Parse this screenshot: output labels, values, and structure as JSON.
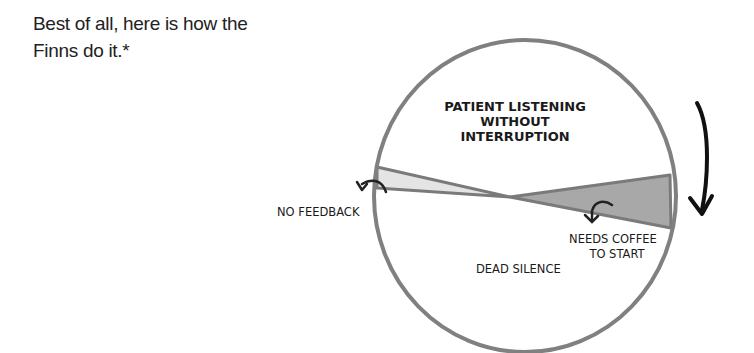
{
  "intro": {
    "line1": "Best of all, here is how the",
    "line2": "Finns do it.*"
  },
  "diagram": {
    "type": "conversation-wheel",
    "labels": {
      "top_line1": "PATIENT LISTENING",
      "top_line2": "WITHOUT",
      "top_line3": "INTERRUPTION",
      "left": "NO FEEDBACK",
      "right_line1": "NEEDS COFFEE",
      "right_line2": "TO START",
      "bottom": "DEAD SILENCE"
    },
    "colors": {
      "outline": "#808080",
      "left_wedge": "#e4e4e4",
      "right_wedge": "#a8a8a8",
      "arrow": "#111111"
    },
    "rotation_direction": "clockwise"
  }
}
